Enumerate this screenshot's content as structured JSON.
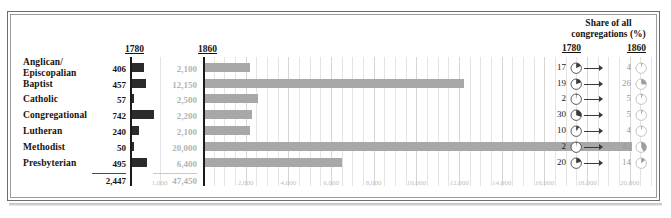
{
  "chart_data": {
    "type": "bar",
    "title": "",
    "categories": [
      "Anglican/ Episcopalian",
      "Baptist",
      "Catholic",
      "Congregational",
      "Lutheran",
      "Methodist",
      "Presbyterian"
    ],
    "series": [
      {
        "name": "1780",
        "values": [
          406,
          457,
          57,
          742,
          240,
          50,
          495
        ],
        "total": 2447,
        "total_label": "2,447",
        "value_labels": [
          "406",
          "457",
          "57",
          "742",
          "240",
          "50",
          "495"
        ],
        "xlim": [
          0,
          1200
        ],
        "ticks": [
          1000
        ],
        "tick_labels": [
          "1,000"
        ]
      },
      {
        "name": "1860",
        "values": [
          2100,
          12150,
          2500,
          2200,
          2100,
          20000,
          6400
        ],
        "total": 47450,
        "total_label": "47,450",
        "value_labels": [
          "2,100",
          "12,150",
          "2,500",
          "2,200",
          "2,100",
          "20,000",
          "6,400"
        ],
        "xlim": [
          0,
          21000
        ],
        "ticks": [
          2000,
          4000,
          6000,
          8000,
          10000,
          12000,
          14000,
          16000,
          18000,
          20000
        ],
        "tick_labels": [
          "2,000",
          "4,000",
          "6,000",
          "8,000",
          "10,000",
          "12,000",
          "14,000",
          "16,000",
          "18,000",
          "20,000"
        ]
      }
    ],
    "xlabel": "",
    "ylabel": "",
    "grid": true,
    "legend": "none"
  },
  "headers": {
    "col_1780": "1780",
    "col_1860": "1860",
    "share_title_line1": "Share of all",
    "share_title_line2": "congregations (%)",
    "share_1780": "1780",
    "share_1860": "1860"
  },
  "rows": [
    {
      "label_line1": "Anglican/",
      "label_line2": "Episcopalian",
      "v1780": "406",
      "v1860": "2,100",
      "share1780": "17",
      "share1860": "4",
      "pie1780": 17,
      "pie1860": 4
    },
    {
      "label_line1": "Baptist",
      "label_line2": "",
      "v1780": "457",
      "v1860": "12,150",
      "share1780": "19",
      "share1860": "26",
      "pie1780": 19,
      "pie1860": 26
    },
    {
      "label_line1": "Catholic",
      "label_line2": "",
      "v1780": "57",
      "v1860": "2,500",
      "share1780": "2",
      "share1860": "5",
      "pie1780": 2,
      "pie1860": 5
    },
    {
      "label_line1": "Congregational",
      "label_line2": "",
      "v1780": "742",
      "v1860": "2,200",
      "share1780": "30",
      "share1860": "5",
      "pie1780": 30,
      "pie1860": 5
    },
    {
      "label_line1": "Lutheran",
      "label_line2": "",
      "v1780": "240",
      "v1860": "2,100",
      "share1780": "10",
      "share1860": "4",
      "pie1780": 10,
      "pie1860": 4
    },
    {
      "label_line1": "Methodist",
      "label_line2": "",
      "v1780": "50",
      "v1860": "20,000",
      "share1780": "2",
      "share1860": "42",
      "pie1780": 2,
      "pie1860": 42
    },
    {
      "label_line1": "Presbyterian",
      "label_line2": "",
      "v1780": "495",
      "v1860": "6,400",
      "share1780": "20",
      "share1860": "14",
      "pie1780": 20,
      "pie1860": 14
    }
  ],
  "totals": {
    "t1780": "2,447",
    "t1860": "47,450"
  },
  "colors": {
    "bar_1780": "#2b2b2b",
    "bar_1860": "#a8a8a8",
    "grid": "#e4e4e4",
    "axis": "#1a1a1a",
    "muted_text": "#b3b3b3"
  }
}
